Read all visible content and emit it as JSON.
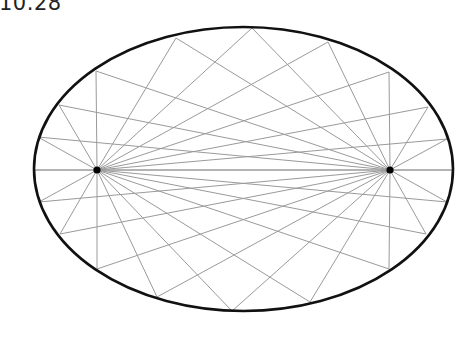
{
  "figure": {
    "label": "10.28",
    "ellipse": {
      "cx": 243.5,
      "cy": 169,
      "rx": 209.5,
      "ry": 142,
      "stroke": "#111111",
      "stroke_width": 2.6
    },
    "foci": [
      {
        "name": "left-focus",
        "x": 97,
        "y": 170
      },
      {
        "name": "right-focus",
        "x": 390,
        "y": 170
      }
    ],
    "boundary_points": [
      [
        34,
        170
      ],
      [
        38,
        137
      ],
      [
        59,
        105
      ],
      [
        96,
        71
      ],
      [
        176,
        38
      ],
      [
        252,
        28
      ],
      [
        328,
        42
      ],
      [
        389,
        72
      ],
      [
        428,
        107
      ],
      [
        447,
        139
      ],
      [
        453,
        170
      ],
      [
        447,
        202
      ],
      [
        426,
        234
      ],
      [
        389,
        269
      ],
      [
        310,
        302
      ],
      [
        232,
        311
      ],
      [
        157,
        297
      ],
      [
        97,
        269
      ],
      [
        60,
        234
      ],
      [
        39,
        202
      ]
    ],
    "ray_color": "#9a9a9a",
    "focus_color": "#000000"
  }
}
